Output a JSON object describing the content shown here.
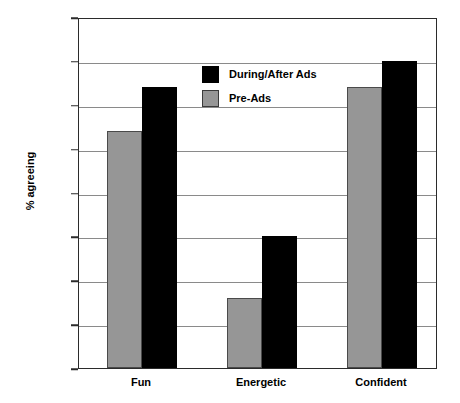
{
  "chart_data": {
    "type": "bar",
    "title": "",
    "xlabel": "",
    "ylabel": "% agreeing",
    "categories": [
      "Fun",
      "Energetic",
      "Confident"
    ],
    "series": [
      {
        "name": "During/After Ads",
        "color": "#000000",
        "values": [
          32,
          15,
          35
        ]
      },
      {
        "name": "Pre-Ads",
        "color": "#969696",
        "values": [
          27,
          8,
          32
        ]
      }
    ],
    "ylim": [
      0,
      40
    ],
    "yticks": [
      0,
      5,
      10,
      15,
      20,
      25,
      30,
      35,
      40
    ],
    "ytick_labels": [
      "0",
      "5",
      "10",
      "15",
      "20",
      "25",
      "30",
      "35",
      "40"
    ],
    "grid": true,
    "legend_position": "upper-center-left",
    "series_order_in_group": [
      "Pre-Ads",
      "During/After Ads"
    ]
  },
  "legend": {
    "items": [
      {
        "label": "During/After Ads",
        "swatch": "black-swatch"
      },
      {
        "label": "Pre-Ads",
        "swatch": "gray-swatch"
      }
    ]
  }
}
